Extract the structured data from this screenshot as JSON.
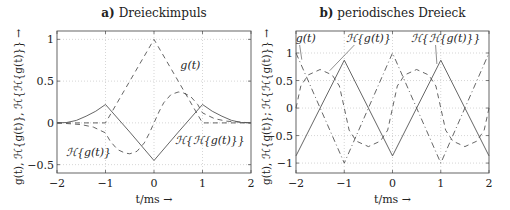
{
  "chart_data": [
    {
      "type": "line",
      "title": "a) Dreieckimpuls",
      "title_prefix": "a)",
      "title_text": "Dreieckimpuls",
      "xlabel": "t/ms →",
      "ylabel": "g(t), ℋ{g(t)}, ℋ{ℋ{g(t)}} →",
      "xlim": [
        -2,
        2
      ],
      "ylim": [
        -0.6,
        1.1
      ],
      "xticks": [
        -2,
        -1,
        0,
        1,
        2
      ],
      "xtick_labels": [
        "−2",
        "−1",
        "0",
        "1",
        "2"
      ],
      "yticks": [
        -0.5,
        0,
        0.5,
        1
      ],
      "ytick_labels": [
        "−0.5",
        "0",
        "0.5",
        "1"
      ],
      "grid": true,
      "series": [
        {
          "name": "g(t)",
          "style": "dashed",
          "x": [
            -2,
            -1,
            0,
            1,
            2
          ],
          "y": [
            0,
            0,
            1,
            0,
            0
          ]
        },
        {
          "name": "ℋ{g(t)}",
          "style": "dashed",
          "x": [
            -2,
            -1.75,
            -1.5,
            -1.25,
            -1,
            -0.9,
            -0.75,
            -0.6,
            -0.5,
            -0.35,
            -0.2,
            -0.1,
            0,
            0.1,
            0.2,
            0.35,
            0.5,
            0.6,
            0.75,
            0.9,
            1,
            1.25,
            1.5,
            1.75,
            2
          ],
          "y": [
            0,
            -0.01,
            -0.02,
            -0.05,
            -0.12,
            -0.22,
            -0.32,
            -0.36,
            -0.37,
            -0.34,
            -0.24,
            -0.13,
            0,
            0.13,
            0.24,
            0.34,
            0.37,
            0.36,
            0.32,
            0.22,
            0.12,
            0.05,
            0.02,
            0.01,
            0
          ]
        },
        {
          "name": "ℋ{ℋ{g(t)}}",
          "style": "solid",
          "x": [
            -2,
            -1.8,
            -1.6,
            -1.4,
            -1.2,
            -1,
            -0.5,
            0,
            0.5,
            1,
            1.2,
            1.4,
            1.6,
            1.8,
            2
          ],
          "y": [
            0,
            0.005,
            0.03,
            0.08,
            0.14,
            0.22,
            -0.11,
            -0.45,
            -0.11,
            0.22,
            0.14,
            0.08,
            0.03,
            0.005,
            0
          ]
        }
      ],
      "annotations": [
        {
          "text": "g(t)",
          "x": 0.75,
          "y": 0.65
        },
        {
          "text": "ℋ{g(t)}",
          "x": -1.35,
          "y": -0.4
        },
        {
          "text": "ℋ{ℋ{g(t)}}",
          "x": 1.15,
          "y": -0.25
        }
      ]
    },
    {
      "type": "line",
      "title": "b) periodisches Dreieck",
      "title_prefix": "b)",
      "title_text": "periodisches Dreieck",
      "xlabel": "t/ms →",
      "ylabel": "g(t), ℋ{g(t)}; ℋ{ℋ{g(t)}} →",
      "xlim": [
        -2,
        2
      ],
      "ylim": [
        -1.18,
        1.4
      ],
      "xticks": [
        -2,
        -1,
        0,
        1,
        2
      ],
      "xtick_labels": [
        "−2",
        "−1",
        "0",
        "1",
        "2"
      ],
      "yticks": [
        -1,
        -0.5,
        0,
        0.5,
        1
      ],
      "ytick_labels": [
        "−1",
        "−0.5",
        "0",
        "0.5",
        "1"
      ],
      "grid": true,
      "series": [
        {
          "name": "g(t)",
          "style": "dashdot",
          "x": [
            -2,
            -1,
            0,
            1,
            2
          ],
          "y": [
            1,
            -1,
            1,
            -1,
            1
          ]
        },
        {
          "name": "ℋ{g(t)}",
          "style": "dashed",
          "x": [
            -2,
            -1.9,
            -1.75,
            -1.5,
            -1.25,
            -1.1,
            -1,
            -0.9,
            -0.75,
            -0.5,
            -0.25,
            -0.1,
            0,
            0.1,
            0.25,
            0.5,
            0.75,
            0.9,
            1,
            1.1,
            1.25,
            1.5,
            1.75,
            1.9,
            2
          ],
          "y": [
            0,
            0.4,
            0.6,
            0.7,
            0.6,
            0.4,
            0,
            -0.4,
            -0.6,
            -0.7,
            -0.6,
            -0.4,
            0,
            0.4,
            0.6,
            0.7,
            0.6,
            0.4,
            0,
            -0.4,
            -0.6,
            -0.7,
            -0.6,
            -0.4,
            0
          ]
        },
        {
          "name": "ℋ{ℋ{g(t)}}",
          "style": "solid",
          "x": [
            -2,
            -1,
            0,
            1,
            2
          ],
          "y": [
            -0.87,
            0.87,
            -0.87,
            0.87,
            -0.87
          ]
        }
      ],
      "annotations": [
        {
          "text": "g(t)",
          "x": -1.8,
          "y": 1.2,
          "arrow_to": [
            -1.88,
            0.88
          ]
        },
        {
          "text": "ℋ{g(t)}",
          "x": -0.5,
          "y": 1.2,
          "arrow_to": [
            -1.3,
            0.68
          ]
        },
        {
          "text": "ℋ{ℋ{g(t)}}",
          "x": 1.1,
          "y": 1.2,
          "arrow_to": [
            0.92,
            0.8
          ]
        }
      ]
    }
  ]
}
